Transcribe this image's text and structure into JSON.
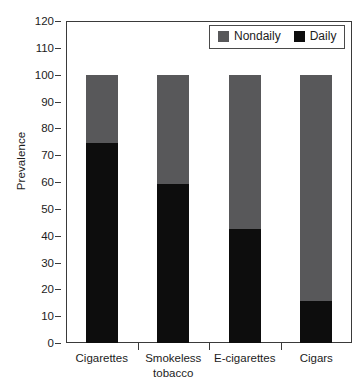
{
  "chart_data": {
    "type": "bar",
    "stacked": true,
    "title": "",
    "xlabel": "",
    "ylabel": "Prevalence",
    "ylim": [
      0,
      120
    ],
    "ytick_step": 10,
    "yticks": [
      120,
      110,
      100,
      90,
      80,
      70,
      60,
      50,
      40,
      30,
      20,
      10,
      0
    ],
    "grid": false,
    "legend_position": "top-right",
    "categories": [
      "Cigarettes",
      "Smokeless tobacco",
      "E-cigarettes",
      "Cigars"
    ],
    "category_lines": [
      [
        "Cigarettes"
      ],
      [
        "Smokeless",
        "tobacco"
      ],
      [
        "E-cigarettes"
      ],
      [
        "Cigars"
      ]
    ],
    "series": [
      {
        "name": "Daily",
        "color": "#0d0d0d",
        "values": [
          74.5,
          59.3,
          42.5,
          15.7
        ]
      },
      {
        "name": "Nondaily",
        "color": "#58585a",
        "values": [
          25.5,
          40.7,
          57.5,
          84.3
        ]
      }
    ],
    "stack_totals": [
      100,
      100,
      100,
      100
    ],
    "annotations": []
  },
  "legend": {
    "entries": [
      {
        "label": "Nondaily",
        "color": "#58585a",
        "swatch_name": "legend-swatch-nondaily"
      },
      {
        "label": "Daily",
        "color": "#0d0d0d",
        "swatch_name": "legend-swatch-daily"
      }
    ]
  },
  "axis": {
    "y_title": "Prevalence"
  }
}
